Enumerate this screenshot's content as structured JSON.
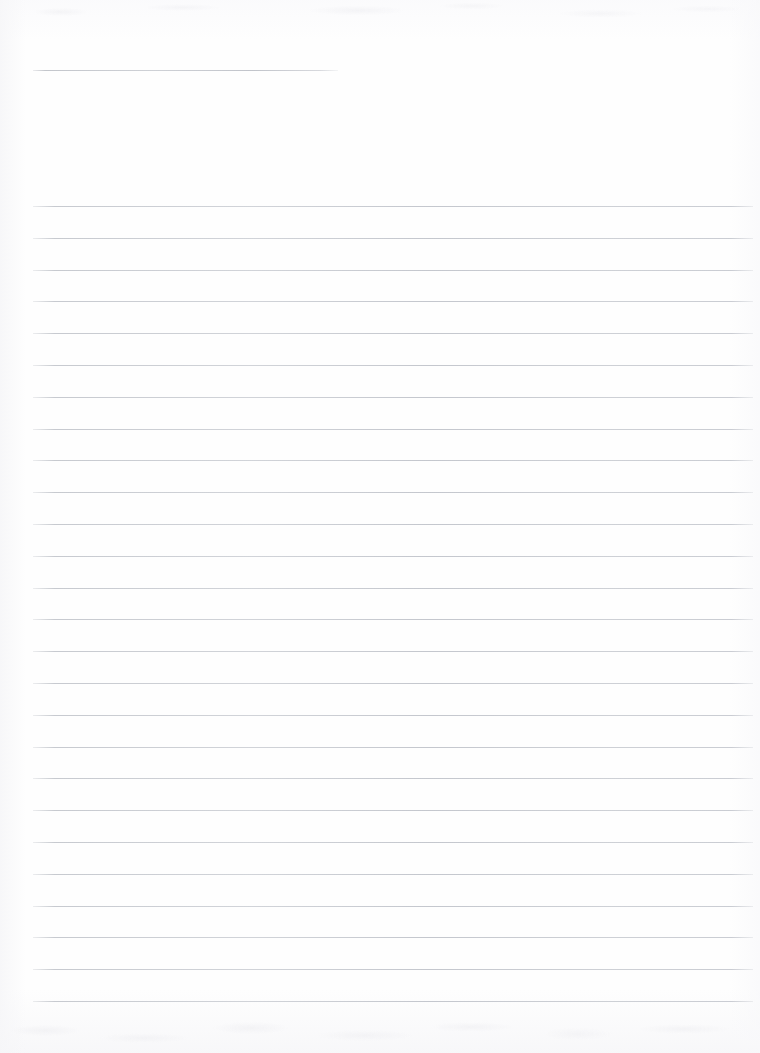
{
  "document": {
    "kind": "ruled-notebook-page",
    "title_text": "",
    "body_text": "",
    "page_width": 760,
    "page_height": 1053,
    "paper_color": "#fefefe",
    "rule_color": "#c4c7cd"
  },
  "header_rule": {
    "name": "title-rule",
    "x": 33,
    "y": 70,
    "width": 305,
    "value": ""
  },
  "ruling": {
    "left_margin": 33,
    "right_edge": 753,
    "line_width": 720,
    "first_line_y": 206,
    "line_spacing": 31.8,
    "line_count": 26,
    "lines": [
      {
        "index": 1,
        "y": 206,
        "value": ""
      },
      {
        "index": 2,
        "y": 237.8,
        "value": ""
      },
      {
        "index": 3,
        "y": 269.6,
        "value": ""
      },
      {
        "index": 4,
        "y": 301.4,
        "value": ""
      },
      {
        "index": 5,
        "y": 333.2,
        "value": ""
      },
      {
        "index": 6,
        "y": 365.0,
        "value": ""
      },
      {
        "index": 7,
        "y": 396.8,
        "value": ""
      },
      {
        "index": 8,
        "y": 428.6,
        "value": ""
      },
      {
        "index": 9,
        "y": 460.4,
        "value": ""
      },
      {
        "index": 10,
        "y": 492.2,
        "value": ""
      },
      {
        "index": 11,
        "y": 524.0,
        "value": ""
      },
      {
        "index": 12,
        "y": 555.8,
        "value": ""
      },
      {
        "index": 13,
        "y": 587.6,
        "value": ""
      },
      {
        "index": 14,
        "y": 619.4,
        "value": ""
      },
      {
        "index": 15,
        "y": 651.2,
        "value": ""
      },
      {
        "index": 16,
        "y": 683.0,
        "value": ""
      },
      {
        "index": 17,
        "y": 714.8,
        "value": ""
      },
      {
        "index": 18,
        "y": 746.6,
        "value": ""
      },
      {
        "index": 19,
        "y": 778.4,
        "value": ""
      },
      {
        "index": 20,
        "y": 810.2,
        "value": ""
      },
      {
        "index": 21,
        "y": 842.0,
        "value": ""
      },
      {
        "index": 22,
        "y": 873.8,
        "value": ""
      },
      {
        "index": 23,
        "y": 905.6,
        "value": ""
      },
      {
        "index": 24,
        "y": 937.4,
        "value": ""
      },
      {
        "index": 25,
        "y": 969.2,
        "value": ""
      },
      {
        "index": 26,
        "y": 1001.0,
        "value": ""
      }
    ]
  }
}
